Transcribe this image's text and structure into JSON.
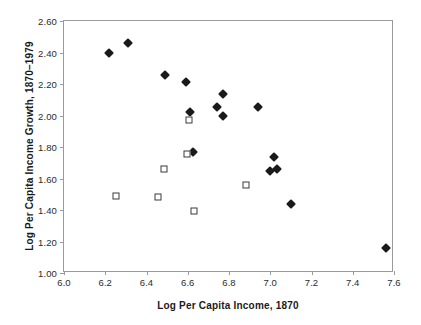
{
  "chart_data": {
    "type": "scatter",
    "title": "",
    "xlabel": "Log Per Capita Income, 1870",
    "ylabel": "Log Per Capita Income Growth, 1870–1979",
    "xlim": [
      6.0,
      7.6
    ],
    "ylim": [
      1.0,
      2.6
    ],
    "xticks": [
      "6.0",
      "6.2",
      "6.4",
      "6.6",
      "6.8",
      "7.0",
      "7.2",
      "7.4",
      "7.6"
    ],
    "yticks": [
      "1.00",
      "1.20",
      "1.40",
      "1.60",
      "1.80",
      "2.00",
      "2.20",
      "2.40",
      "2.60"
    ],
    "xtick_step": 0.2,
    "ytick_step": 0.2,
    "grid": false,
    "legend": "none",
    "series": [
      {
        "name": "filled-diamond",
        "marker": "filled-diamond",
        "color": "#1a1a1a",
        "points": [
          [
            6.22,
            2.4
          ],
          [
            6.31,
            2.46
          ],
          [
            6.49,
            2.26
          ],
          [
            6.59,
            2.215
          ],
          [
            6.61,
            2.02
          ],
          [
            6.77,
            2.135
          ],
          [
            6.74,
            2.055
          ],
          [
            6.77,
            2.0
          ],
          [
            6.94,
            2.055
          ],
          [
            6.625,
            1.77
          ],
          [
            7.02,
            1.735
          ],
          [
            7.035,
            1.66
          ],
          [
            7.0,
            1.645
          ],
          [
            7.1,
            1.435
          ],
          [
            7.56,
            1.16
          ]
        ]
      },
      {
        "name": "open-square",
        "marker": "open-square",
        "color": "#3a3a3a",
        "points": [
          [
            6.605,
            1.97
          ],
          [
            6.595,
            1.755
          ],
          [
            6.485,
            1.66
          ],
          [
            6.88,
            1.56
          ],
          [
            6.25,
            1.49
          ],
          [
            6.455,
            1.48
          ],
          [
            6.63,
            1.395
          ]
        ]
      }
    ]
  },
  "axis_titles": {
    "x": "Log Per Capita Income, 1870",
    "y": "Log Per Capita Income Growth, 1870–1979"
  }
}
